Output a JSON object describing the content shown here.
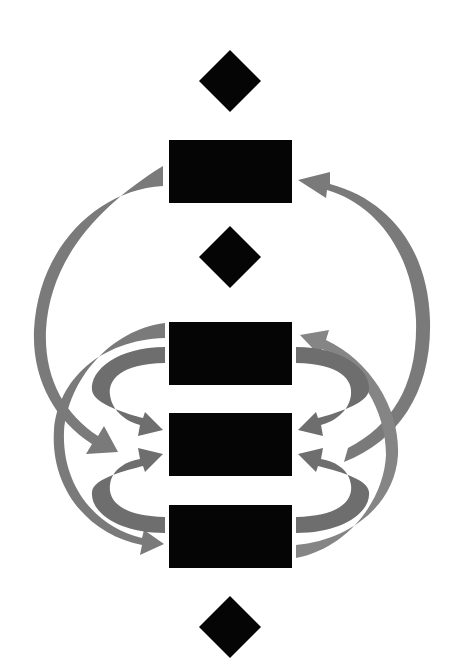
{
  "diagram": {
    "type": "flow-cycle",
    "background": "#ffffff",
    "node_color": "#050505",
    "arrow_color": "#7a7a7a",
    "text_labels": [],
    "nodes": [
      {
        "id": "diamond-1",
        "shape": "diamond",
        "cx": 230,
        "cy": 81,
        "r": 31
      },
      {
        "id": "box-1",
        "shape": "rect",
        "x": 169,
        "y": 140,
        "w": 123,
        "h": 63
      },
      {
        "id": "diamond-2",
        "shape": "diamond",
        "cx": 230,
        "cy": 257,
        "r": 31
      },
      {
        "id": "box-2",
        "shape": "rect",
        "x": 169,
        "y": 322,
        "w": 123,
        "h": 63
      },
      {
        "id": "box-3",
        "shape": "rect",
        "x": 169,
        "y": 413,
        "w": 123,
        "h": 63
      },
      {
        "id": "box-4",
        "shape": "rect",
        "x": 169,
        "y": 505,
        "w": 123,
        "h": 63
      },
      {
        "id": "diamond-3",
        "shape": "diamond",
        "cx": 230,
        "cy": 627,
        "r": 31
      }
    ],
    "edges": [
      {
        "from": "box-1",
        "to": "box-3",
        "side": "left",
        "style": "large-arc"
      },
      {
        "from": "box-2",
        "to": "box-4",
        "side": "left",
        "style": "large-arc"
      },
      {
        "from": "box-2",
        "to": "box-3",
        "side": "left",
        "style": "tight-c"
      },
      {
        "from": "box-4",
        "to": "box-3",
        "side": "left",
        "style": "tight-c"
      },
      {
        "from": "box-3",
        "to": "box-1",
        "side": "right",
        "style": "large-arc"
      },
      {
        "from": "box-4",
        "to": "box-2",
        "side": "right",
        "style": "large-arc"
      },
      {
        "from": "box-2",
        "to": "box-3",
        "side": "right",
        "style": "tight-c"
      },
      {
        "from": "box-4",
        "to": "box-3",
        "side": "right",
        "style": "tight-c"
      }
    ]
  }
}
